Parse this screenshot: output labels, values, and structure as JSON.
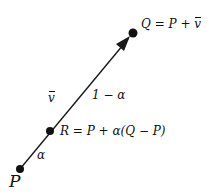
{
  "diagram": {
    "type": "parametric line segment",
    "colors": {
      "line": "#1a1a1a",
      "text": "#111111",
      "background": "#ffffff"
    },
    "points": [
      {
        "id": "P",
        "label": "P",
        "x": 20,
        "y": 169
      },
      {
        "id": "R",
        "label": "R = P + α(Q − P)",
        "x": 50,
        "y": 131
      },
      {
        "id": "Q",
        "label": "Q = P + v",
        "x": 133,
        "y": 33
      }
    ],
    "labels": {
      "q_eq_prefix": "Q = P + ",
      "q_eq_vec": "v",
      "r_eq": "R = P + α(Q − P)",
      "p": "P",
      "alpha": "α",
      "one_minus_alpha": "1 − α",
      "vec": "v"
    },
    "arrow": {
      "from": "P",
      "to": "Q",
      "head_at": "Q"
    }
  }
}
